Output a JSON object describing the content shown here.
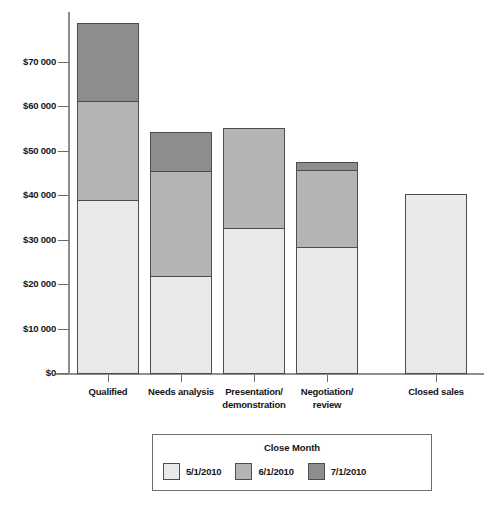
{
  "chart_data": {
    "type": "bar",
    "subtype": "stacked-column",
    "title": "",
    "xlabel": "",
    "ylabel": "",
    "ylim": [
      0,
      80000
    ],
    "grid": false,
    "axis": {
      "y_ticks": [
        0,
        10000,
        20000,
        30000,
        40000,
        50000,
        60000,
        70000
      ],
      "y_tick_labels": [
        "$0",
        "$10 000",
        "$20 000",
        "$30 000",
        "$40 000",
        "$50 000",
        "$60 000",
        "$70 000"
      ]
    },
    "categories": [
      "Qualified",
      "Needs analysis",
      "Presentation/\ndemonstration",
      "Negotiation/\nreview",
      "Closed sales"
    ],
    "series": [
      {
        "name": "5/1/2010",
        "color": "#e9e9e9",
        "values": [
          39000,
          21800,
          32700,
          28400,
          40300
        ]
      },
      {
        "name": "6/1/2010",
        "color": "#b4b4b4",
        "values": [
          22300,
          23700,
          22500,
          17300,
          0
        ]
      },
      {
        "name": "7/1/2010",
        "color": "#8d8d8d",
        "values": [
          17500,
          8700,
          0,
          1800,
          0
        ]
      }
    ],
    "totals": [
      78800,
      54200,
      55200,
      47500,
      40300
    ],
    "legend": {
      "title": "Close Month",
      "position": "bottom",
      "entries": [
        "5/1/2010",
        "6/1/2010",
        "7/1/2010"
      ]
    }
  },
  "categories_display": [
    {
      "line1": "Qualified",
      "line2": ""
    },
    {
      "line1": "Needs analysis",
      "line2": ""
    },
    {
      "line1": "Presentation/",
      "line2": "demonstration"
    },
    {
      "line1": "Negotiation/",
      "line2": "review"
    },
    {
      "line1": "Closed sales",
      "line2": ""
    }
  ]
}
